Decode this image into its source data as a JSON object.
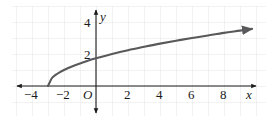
{
  "figure": {
    "background_color": "#ffffff",
    "grid_color": "#e2e2e4",
    "axis_color": "#1a1a1a",
    "curve_color": "#59595b"
  },
  "axes": {
    "x_axis_name": "x",
    "y_axis_name": "y",
    "origin_label": "O",
    "x_tick_labels": [
      "−4",
      "−2",
      "2",
      "4",
      "6",
      "8"
    ],
    "y_tick_labels": [
      "2",
      "4"
    ]
  },
  "chart_data": {
    "type": "line",
    "title": "",
    "xlabel": "x",
    "ylabel": "y",
    "xlim": [
      -5,
      10.5
    ],
    "ylim": [
      -1.5,
      4.7
    ],
    "xticks": [
      -4,
      -2,
      2,
      4,
      6,
      8
    ],
    "yticks": [
      2,
      4
    ],
    "xtick_labels": [
      "−4",
      "−2",
      "2",
      "4",
      "6",
      "8"
    ],
    "ytick_labels": [
      "2",
      "4"
    ],
    "grid": true,
    "grid_spacing": 1,
    "legend": "none",
    "origin_label": "O",
    "series": [
      {
        "name": "y = √(x + 3)",
        "equation": "y = sqrt(x + 3)",
        "domain_start": -3,
        "domain_end": 9.75,
        "arrow_end": true,
        "x": [
          -3,
          -2.75,
          -2.5,
          -2.25,
          -2,
          -1.5,
          -1,
          -0.5,
          0,
          1,
          2,
          3,
          4,
          5,
          6,
          7,
          8,
          9,
          9.75
        ],
        "y": [
          0,
          0.5,
          0.71,
          0.87,
          1,
          1.22,
          1.41,
          1.58,
          1.73,
          2,
          2.24,
          2.45,
          2.65,
          2.83,
          3,
          3.16,
          3.32,
          3.46,
          3.57
        ]
      }
    ]
  },
  "tick_positions": {
    "x": [
      {
        "label": "−4",
        "px": 31,
        "py": 95
      },
      {
        "label": "−2",
        "px": 63,
        "py": 95
      },
      {
        "label": "2",
        "px": 128,
        "py": 95
      },
      {
        "label": "4",
        "px": 160,
        "py": 95
      },
      {
        "label": "6",
        "px": 192,
        "py": 95
      },
      {
        "label": "8",
        "px": 224,
        "py": 95
      }
    ],
    "y": [
      {
        "label": "2",
        "px": 88,
        "py": 55
      },
      {
        "label": "4",
        "px": 88,
        "py": 23
      }
    ]
  }
}
